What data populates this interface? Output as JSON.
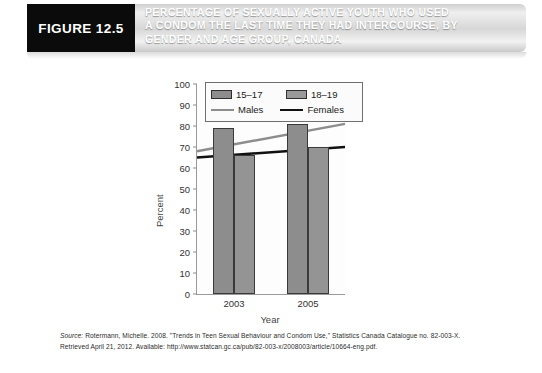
{
  "figure": {
    "tag": "FIGURE 12.5",
    "title_lines": [
      "PERCENTAGE OF SEXUALLY ACTIVE YOUTH WHO USED",
      "A CONDOM THE LAST TIME THEY HAD INTERCOURSE, BY",
      "GENDER AND AGE GROUP, CANADA"
    ]
  },
  "source": {
    "label": "Source:",
    "text": " Rotermann, Michelle. 2008. \"Trends in Teen Sexual Behaviour and Condom Use,\" Statistics Canada Catalogue no. 82-003-X. Retrieved April 21, 2012. Available: http://www.statcan.gc.ca/pub/82-003-x/2008003/article/10664-eng.pdf."
  },
  "chart_data": {
    "type": "bar",
    "title": "",
    "xlabel": "Year",
    "ylabel": "Percent",
    "categories": [
      "2003",
      "2005"
    ],
    "ylim": [
      0,
      100
    ],
    "yticks": [
      0,
      10,
      20,
      30,
      40,
      50,
      60,
      70,
      80,
      90,
      100
    ],
    "grid": false,
    "legend_position": "top-center",
    "series": [
      {
        "name": "15–17",
        "type": "bar",
        "values": [
          79,
          81
        ],
        "color": "#8d8d8d"
      },
      {
        "name": "18–19",
        "type": "bar",
        "values": [
          66,
          70
        ],
        "color": "#949494"
      },
      {
        "name": "Males",
        "type": "line",
        "values": [
          68,
          81
        ],
        "color": "#8d8d8d"
      },
      {
        "name": "Females",
        "type": "line",
        "values": [
          65,
          70
        ],
        "color": "#111111"
      }
    ]
  }
}
